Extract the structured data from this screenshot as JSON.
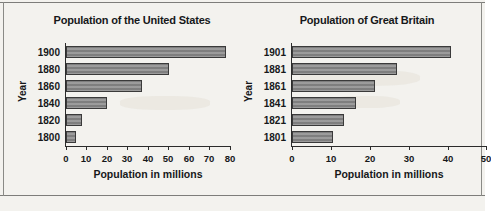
{
  "page": {
    "background_color": "#f3f2ee",
    "bar_color": "#8f8f8f",
    "axis_color": "#2b2b2b",
    "text_color": "#16181a"
  },
  "charts": [
    {
      "title": "Population of the United States",
      "xlabel": "Population in millions",
      "ylabel": "Year",
      "xticks": [
        "0",
        "10",
        "20",
        "30",
        "40",
        "50",
        "60",
        "70",
        "80"
      ],
      "categories": [
        "1900",
        "1880",
        "1860",
        "1840",
        "1820",
        "1800"
      ],
      "values": [
        78,
        50,
        37,
        20,
        8,
        5
      ]
    },
    {
      "title": "Population of Great Britain",
      "xlabel": "Population in millions",
      "ylabel": "Year",
      "xticks": [
        "0",
        "10",
        "20",
        "30",
        "40",
        "50"
      ],
      "categories": [
        "1901",
        "1881",
        "1861",
        "1841",
        "1821",
        "1801"
      ],
      "values": [
        41,
        27,
        21.5,
        16.5,
        13.5,
        10.5
      ]
    }
  ],
  "chart_data": [
    {
      "type": "bar",
      "orientation": "horizontal",
      "title": "Population of the United States",
      "xlabel": "Population in millions",
      "ylabel": "Year",
      "categories": [
        "1900",
        "1880",
        "1860",
        "1840",
        "1820",
        "1800"
      ],
      "values": [
        78,
        50,
        37,
        20,
        8,
        5
      ],
      "xlim": [
        0,
        80
      ],
      "xticks": [
        0,
        10,
        20,
        30,
        40,
        50,
        60,
        70,
        80
      ],
      "grid": false,
      "legend": false
    },
    {
      "type": "bar",
      "orientation": "horizontal",
      "title": "Population of Great Britain",
      "xlabel": "Population in millions",
      "ylabel": "Year",
      "categories": [
        "1901",
        "1881",
        "1861",
        "1841",
        "1821",
        "1801"
      ],
      "values": [
        41,
        27,
        21.5,
        16.5,
        13.5,
        10.5
      ],
      "xlim": [
        0,
        50
      ],
      "xticks": [
        0,
        10,
        20,
        30,
        40,
        50
      ],
      "grid": false,
      "legend": false
    }
  ]
}
